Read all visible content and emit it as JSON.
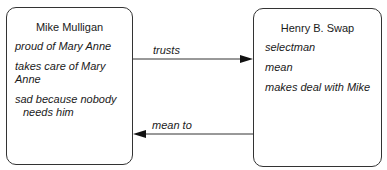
{
  "entities": [
    {
      "name": "Mike Mulligan",
      "attributes": [
        "proud of Mary Anne",
        "takes care of Mary Anne",
        "sad because nobody",
        "needs him"
      ]
    },
    {
      "name": "Henry B. Swap",
      "attributes": [
        "selectman",
        "mean",
        "makes deal with Mike"
      ]
    }
  ],
  "relations": [
    {
      "label": "trusts",
      "from": "Mike Mulligan",
      "to": "Henry B. Swap"
    },
    {
      "label": "mean to",
      "from": "Henry B. Swap",
      "to": "Mike Mulligan"
    }
  ]
}
